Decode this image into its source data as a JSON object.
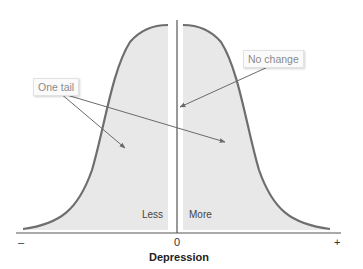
{
  "diagram": {
    "callouts": {
      "one_tail": "One tail",
      "no_change": "No change"
    },
    "regions": {
      "left": "Less",
      "right": "More"
    },
    "axis": {
      "title": "Depression",
      "ticks": {
        "min": "–",
        "center": "0",
        "max": "+"
      }
    },
    "colors": {
      "curve": "#6e6e6e",
      "fill": "#e8e8e8",
      "axis": "#555555",
      "arrow": "#6a6a6a",
      "callout_text": "#8a8a8a"
    }
  }
}
